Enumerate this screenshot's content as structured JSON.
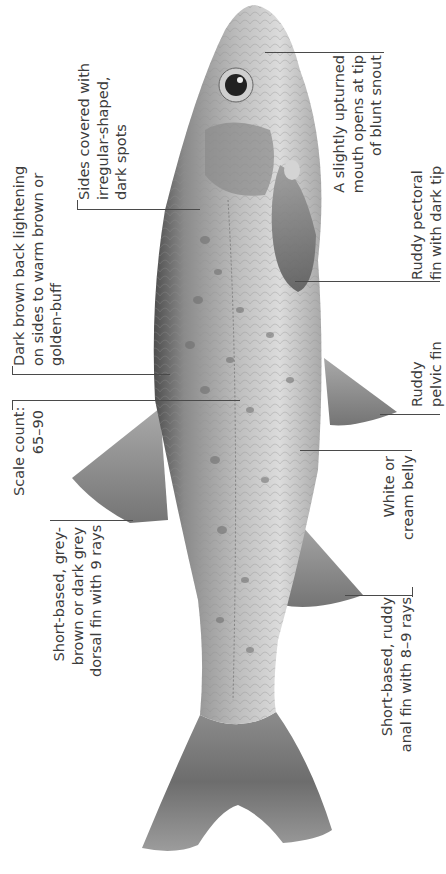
{
  "figure": {
    "palette": {
      "background": "#ffffff",
      "text": "#3c3c3c",
      "leader_line": "#4a4a4a",
      "body_dark": "#5a5a5a",
      "body_light": "#d8d8d8"
    }
  },
  "annotations": {
    "mouth": {
      "lines": [
        "A slightly upturned",
        "mouth opens at tip",
        "of blunt snout"
      ]
    },
    "spots": {
      "lines": [
        "Sides covered with",
        "irregular-shaped,",
        "dark spots"
      ]
    },
    "back": {
      "lines": [
        "Dark brown back lightening",
        "on sides to warm brown or",
        "golden-buff"
      ]
    },
    "scales": {
      "lines": [
        "Scale count:",
        "65–90"
      ]
    },
    "dorsal": {
      "lines": [
        "Short-based, grey-",
        "brown or dark grey",
        "dorsal fin with 9 rays"
      ]
    },
    "pectoral": {
      "lines": [
        "Ruddy pectoral",
        "fin with dark tip"
      ]
    },
    "pelvic": {
      "lines": [
        "Ruddy",
        "pelvic fin"
      ]
    },
    "belly": {
      "lines": [
        "White or",
        "cream belly"
      ]
    },
    "anal": {
      "lines": [
        "Short-based, ruddy",
        "anal fin with 8–9 rays"
      ]
    }
  }
}
